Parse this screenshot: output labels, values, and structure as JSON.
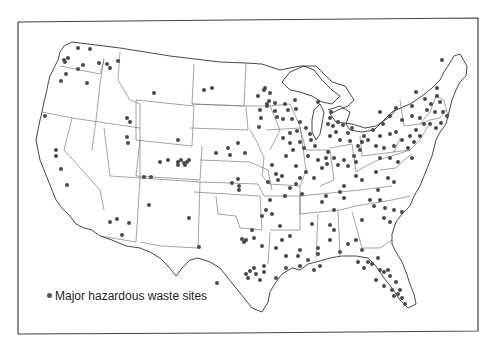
{
  "figure": {
    "type": "map",
    "legend": {
      "symbol": "dot",
      "label": "Major hazardous waste sites"
    },
    "colors": {
      "outline": "#333333",
      "state_lines": "#555555",
      "dots": "#4a4a4a",
      "frame": "#444444",
      "background": "#ffffff"
    }
  }
}
